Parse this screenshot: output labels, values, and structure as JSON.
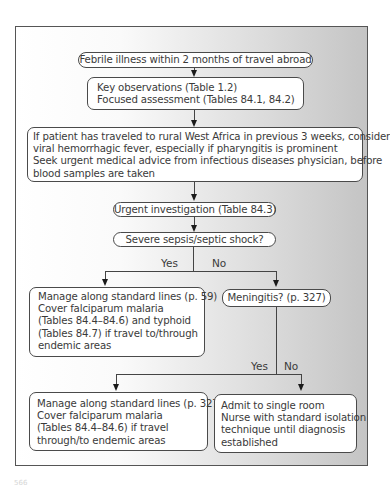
{
  "flowchart": {
    "start": "Febrile illness within 2 months of travel abroad",
    "assessment": [
      "Key observations (Table 1.2)",
      "Focused assessment (Tables 84.1, 84.2)"
    ],
    "warning": [
      "If patient has traveled to rural West Africa in previous 3 weeks, consider",
      "viral hemorrhagic fever, especially if pharyngitis is prominent",
      "Seek urgent medical advice from infectious diseases physician, before",
      "blood samples are taken"
    ],
    "investigation": "Urgent investigation (Table 84.3)",
    "decision1": {
      "question": "Severe sepsis/septic shock?",
      "yes_label": "Yes",
      "no_label": "No"
    },
    "sepsis_yes": [
      "Manage along standard lines (p. 59)",
      "Cover falciparum malaria",
      "(Tables 84.4–84.6) and typhoid",
      "(Tables 84.7) if travel to/through",
      "endemic areas"
    ],
    "decision2": {
      "question": "Meningitis? (p. 327)",
      "yes_label": "Yes",
      "no_label": "No"
    },
    "meningitis_yes": [
      "Manage along standard lines (p. 327)",
      "Cover falciparum malaria",
      "(Tables 84.4–84.6) if travel",
      "through/to endemic areas"
    ],
    "meningitis_no": [
      "Admit to single room",
      "Nurse with standard isolation",
      "technique until diagnosis",
      "established"
    ]
  },
  "page_number": "566"
}
